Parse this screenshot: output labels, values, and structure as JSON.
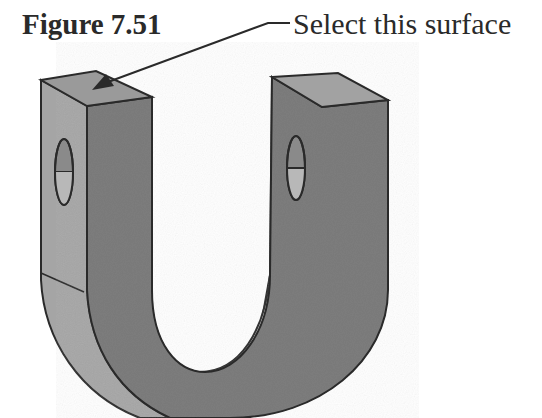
{
  "figure": {
    "title": "Figure 7.51",
    "callout": "Select this surface",
    "colors": {
      "front_face": "#7b7b7b",
      "side_face": "#a9a9a9",
      "top_face": "#9a9a9a",
      "inner_face": "#c8c8c8",
      "outline": "#2a2a2a"
    }
  }
}
